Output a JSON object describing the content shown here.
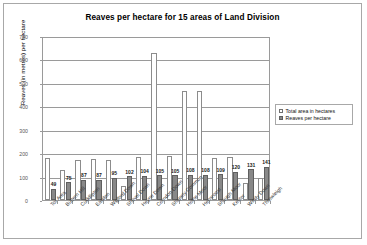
{
  "chart_data": {
    "type": "bar",
    "title": "Reaves per hectare for 15 areas of Land Division",
    "xlabel": "",
    "ylabel": "Reaves (in metres) per hectare",
    "ylim": [
      0,
      700
    ],
    "ytick_step": 100,
    "yticks": [
      "0",
      "100",
      "200",
      "300",
      "400",
      "500",
      "600",
      "700"
    ],
    "grid": true,
    "legend_position": "right",
    "categories": [
      "Tor Area",
      "Buttern Hill",
      "Cuddlipton",
      "Easdon",
      "Wigford Down",
      "Shovel Down",
      "Heyne Down",
      "Corndon Down",
      "Shapely Common",
      "Holne Moor",
      "Hensroost",
      "Shaugh Moor",
      "Kestor",
      "Windy Down",
      "Throwleigh"
    ],
    "series": [
      {
        "name": "Total area in hectares",
        "color": "#ffffff",
        "values": [
          181,
          126,
          170,
          176,
          171,
          60,
          185,
          627,
          186,
          465,
          466,
          181,
          185,
          74,
          95
        ]
      },
      {
        "name": "Reaves per hectare",
        "color": "#888888",
        "values": [
          49,
          75,
          87,
          87,
          95,
          102,
          104,
          105,
          105,
          108,
          108,
          109,
          120,
          131,
          141
        ],
        "labels": [
          "49",
          "75",
          "87",
          "87",
          "95",
          "102",
          "104",
          "105",
          "105",
          "108",
          "108",
          "109",
          "120",
          "131",
          "141"
        ]
      }
    ]
  },
  "legend": {
    "items": [
      {
        "label": "Total area in hectares"
      },
      {
        "label": "Reaves per hectare"
      }
    ]
  }
}
